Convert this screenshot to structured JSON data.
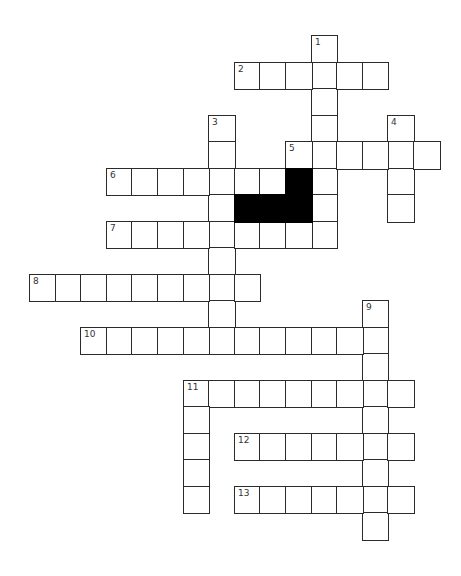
{
  "puzzle": {
    "type": "crossword",
    "grid": {
      "origin_x": 29,
      "origin_y": 35,
      "cell_width": 25.6,
      "cell_height": 26.5,
      "line_color": "#2b2b2b",
      "block_color": "#000000"
    },
    "entries": [
      {
        "number": "1",
        "direction": "down",
        "row": 0,
        "col": 11,
        "length": 8
      },
      {
        "number": "2",
        "direction": "across",
        "row": 1,
        "col": 8,
        "length": 6
      },
      {
        "number": "3",
        "direction": "down",
        "row": 3,
        "col": 7,
        "length": 9
      },
      {
        "number": "4",
        "direction": "down",
        "row": 3,
        "col": 14,
        "length": 4
      },
      {
        "number": "5",
        "direction": "across",
        "row": 4,
        "col": 10,
        "length": 6
      },
      {
        "number": "6",
        "direction": "across",
        "row": 5,
        "col": 3,
        "length": 7
      },
      {
        "number": "7",
        "direction": "across",
        "row": 7,
        "col": 3,
        "length": 9
      },
      {
        "number": "8",
        "direction": "across",
        "row": 9,
        "col": 0,
        "length": 9
      },
      {
        "number": "9",
        "direction": "down",
        "row": 10,
        "col": 13,
        "length": 9
      },
      {
        "number": "10",
        "direction": "across",
        "row": 11,
        "col": 2,
        "length": 12
      },
      {
        "number": "11",
        "direction": "across",
        "row": 13,
        "col": 6,
        "length": 9
      },
      {
        "number": "11",
        "direction": "down",
        "row": 13,
        "col": 6,
        "length": 5
      },
      {
        "number": "12",
        "direction": "across",
        "row": 15,
        "col": 8,
        "length": 7
      },
      {
        "number": "13",
        "direction": "across",
        "row": 17,
        "col": 8,
        "length": 7
      }
    ],
    "black_cells": [
      {
        "row": 5,
        "col": 10
      },
      {
        "row": 6,
        "col": 8
      },
      {
        "row": 6,
        "col": 9
      },
      {
        "row": 6,
        "col": 10
      }
    ]
  }
}
